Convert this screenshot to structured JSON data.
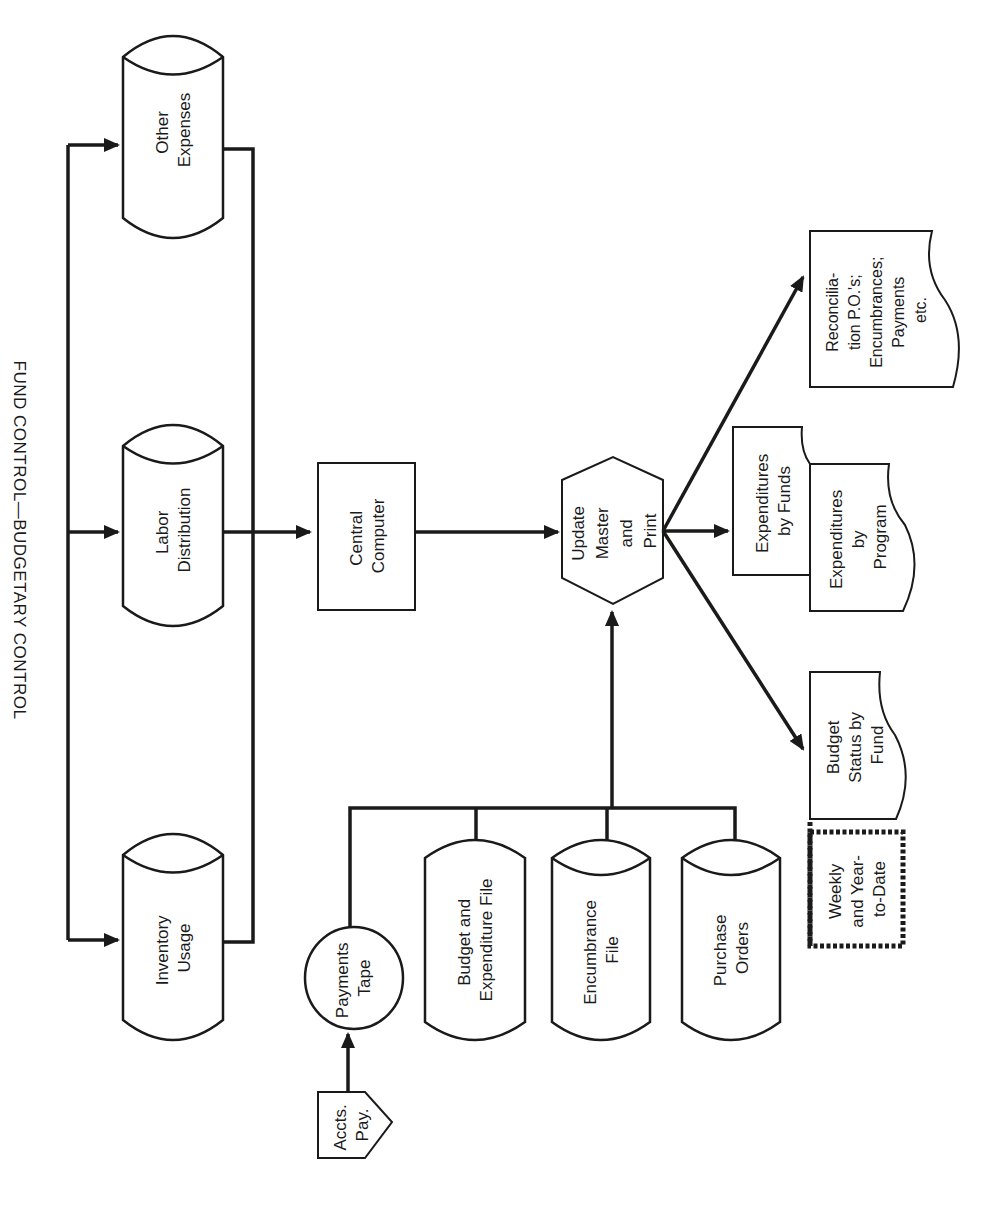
{
  "title": "FUND CONTROL—BUDGETARY CONTROL",
  "colors": {
    "ink": "#1a1a1a",
    "paper": "#ffffff"
  },
  "inputs": {
    "other_expenses": [
      "Other",
      "Expenses"
    ],
    "labor_distribution": [
      "Labor",
      "Distribution"
    ],
    "inventory_usage": [
      "Inventory",
      "Usage"
    ]
  },
  "central_computer": [
    "Central",
    "Computer"
  ],
  "update_master": [
    "Update",
    "Master",
    "and",
    "Print"
  ],
  "files": {
    "payments_tape": [
      "Payments",
      "Tape"
    ],
    "accts_pay": [
      "Accts.",
      "Pay."
    ],
    "budget_expenditure": [
      "Budget and",
      "Expenditure File"
    ],
    "encumbrance": [
      "Encumbrance",
      "File"
    ],
    "purchase_orders": [
      "Purchase",
      "Orders"
    ]
  },
  "outputs": {
    "reconciliation": [
      "Reconcilia-",
      "tion P.O.'s;",
      "Encumbrances;",
      "Payments",
      "etc."
    ],
    "expenditures_funds": [
      "Expenditures",
      "by Funds"
    ],
    "expenditures_program": [
      "Expenditures",
      "by",
      "Program"
    ],
    "budget_status": [
      "Budget",
      "Status by",
      "Fund"
    ],
    "weekly": [
      "Weekly",
      "and Year-",
      "to-Date"
    ]
  }
}
